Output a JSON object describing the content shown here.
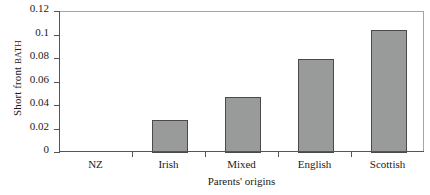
{
  "chart_data": {
    "type": "bar",
    "title": "",
    "categories": [
      "NZ",
      "Irish",
      "Mixed",
      "English",
      "Scottish"
    ],
    "values": [
      0,
      0.028,
      0.048,
      0.08,
      0.105
    ],
    "xlabel": "Parents' origins",
    "ylabel": "Short front BATH",
    "ylabel_parts": {
      "main": "Short front ",
      "smallcaps": "BATH"
    },
    "ylim": [
      0,
      0.12
    ],
    "yticks": [
      0,
      0.02,
      0.04,
      0.06,
      0.08,
      0.1,
      0.12
    ],
    "ytick_labels": [
      "0",
      "0.02",
      "0.04",
      "0.06",
      "0.08",
      "0.1",
      "0.12"
    ],
    "grid": false,
    "legend": null,
    "bar_color": "#999a9a",
    "bar_edge_color": "#4a4a4a",
    "axis_color": "#555555",
    "background": "#ffffff"
  }
}
